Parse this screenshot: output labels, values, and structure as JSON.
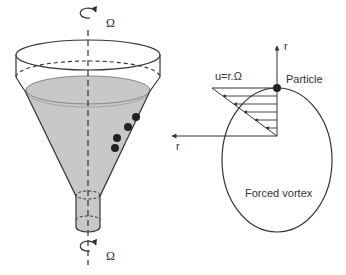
{
  "diagram": {
    "colors": {
      "stroke": "#333333",
      "liquid": "#c8c8c8",
      "particle": "#222222",
      "background": "#ffffff"
    },
    "funnel": {
      "rotation_symbol_top": "Ω",
      "rotation_symbol_bottom": "Ω",
      "particle_count": 4
    },
    "vortex": {
      "velocity_label": "u=r.Ω",
      "particle_label": "Particle",
      "axis_up_label": "r",
      "axis_left_label": "r",
      "caption": "Forced vortex",
      "velocity_arrow_count": 6
    }
  }
}
